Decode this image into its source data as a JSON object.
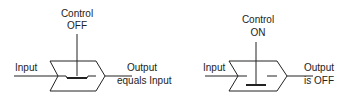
{
  "switches": [
    {
      "id": "off",
      "control_label": "Control",
      "control_state": "OFF",
      "input_label": "Input",
      "output_line1": "Output",
      "output_line2": "equals Input"
    },
    {
      "id": "on",
      "control_label": "Control",
      "control_state": "ON",
      "input_label": "Input",
      "output_line1": "Output",
      "output_line2": "is OFF"
    }
  ],
  "colors": {
    "stroke": "#222222",
    "background": "#ffffff"
  }
}
